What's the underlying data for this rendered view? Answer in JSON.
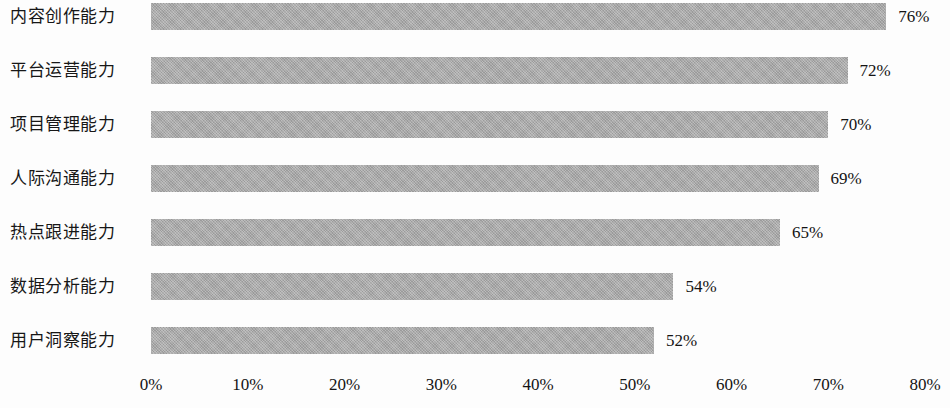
{
  "chart_data": {
    "type": "bar",
    "orientation": "horizontal",
    "title": "",
    "subtitle": "",
    "xlabel": "",
    "ylabel": "",
    "categories": [
      "内容创作能力",
      "平台运营能力",
      "项目管理能力",
      "人际沟通能力",
      "热点跟进能力",
      "数据分析能力",
      "用户洞察能力"
    ],
    "values": [
      76,
      72,
      70,
      69,
      65,
      54,
      52
    ],
    "value_labels": [
      "76%",
      "72%",
      "70%",
      "69%",
      "65%",
      "54%",
      "52%"
    ],
    "xlim": [
      0,
      80
    ],
    "xticks": [
      0,
      10,
      20,
      30,
      40,
      50,
      60,
      70,
      80
    ],
    "xtick_labels": [
      "0%",
      "10%",
      "20%",
      "30%",
      "40%",
      "50%",
      "60%",
      "70%",
      "80%"
    ],
    "grid": false,
    "legend": false,
    "legend_position": "none",
    "bar_color": "#a9a9a9",
    "text_color": "#141414",
    "background_color": "#fdfdfd",
    "value_label_position": "outside-end"
  }
}
